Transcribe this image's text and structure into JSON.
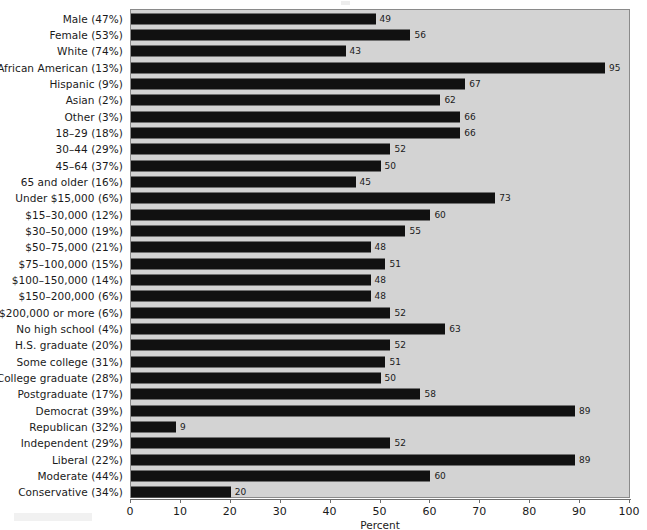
{
  "chart_data": {
    "type": "bar",
    "orientation": "horizontal",
    "title": "",
    "xlabel": "Percent",
    "ylabel": "",
    "xlim": [
      0,
      100
    ],
    "xticks": [
      0,
      10,
      20,
      30,
      40,
      50,
      60,
      70,
      80,
      90,
      100
    ],
    "grid": false,
    "legend": false,
    "bar_color": "#111111",
    "panel_color": "#d3d3d3",
    "categories": [
      "Male (47%)",
      "Female (53%)",
      "White (74%)",
      "African American (13%)",
      "Hispanic (9%)",
      "Asian (2%)",
      "Other (3%)",
      "18–29 (18%)",
      "30–44 (29%)",
      "45–64 (37%)",
      "65 and older (16%)",
      "Under $15,000 (6%)",
      "$15–30,000 (12%)",
      "$30–50,000 (19%)",
      "$50–75,000 (21%)",
      "$75–100,000 (15%)",
      "$100–150,000 (14%)",
      "$150–200,000 (6%)",
      "$200,000 or more (6%)",
      "No high school (4%)",
      "H.S. graduate (20%)",
      "Some college (31%)",
      "College graduate (28%)",
      "Postgraduate (17%)",
      "Democrat (39%)",
      "Republican (32%)",
      "Independent (29%)",
      "Liberal (22%)",
      "Moderate (44%)",
      "Conservative (34%)"
    ],
    "values": [
      49,
      56,
      43,
      95,
      67,
      62,
      66,
      66,
      52,
      50,
      45,
      73,
      60,
      55,
      48,
      51,
      48,
      48,
      52,
      63,
      52,
      51,
      50,
      58,
      89,
      9,
      52,
      89,
      60,
      20
    ]
  }
}
